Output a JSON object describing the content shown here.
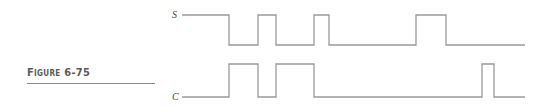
{
  "figure": {
    "label": "Figure 6-75"
  },
  "signals": [
    {
      "name": "S",
      "label_pos": [
        172,
        18
      ],
      "high_y": 15,
      "low_y": 45,
      "points": [
        [
          182,
          15
        ],
        [
          229,
          15
        ],
        [
          229,
          45
        ],
        [
          258,
          45
        ],
        [
          258,
          15
        ],
        [
          276,
          15
        ],
        [
          276,
          45
        ],
        [
          314,
          45
        ],
        [
          314,
          15
        ],
        [
          329,
          15
        ],
        [
          329,
          45
        ],
        [
          416,
          45
        ],
        [
          416,
          15
        ],
        [
          446,
          15
        ],
        [
          446,
          45
        ],
        [
          525,
          45
        ]
      ]
    },
    {
      "name": "C",
      "label_pos": [
        172,
        100
      ],
      "high_y": 64,
      "low_y": 97,
      "points": [
        [
          182,
          97
        ],
        [
          229,
          97
        ],
        [
          229,
          64
        ],
        [
          258,
          64
        ],
        [
          258,
          97
        ],
        [
          276,
          97
        ],
        [
          276,
          64
        ],
        [
          314,
          64
        ],
        [
          314,
          97
        ],
        [
          482,
          97
        ],
        [
          482,
          64
        ],
        [
          494,
          64
        ],
        [
          494,
          97
        ],
        [
          525,
          97
        ]
      ]
    }
  ],
  "colors": {
    "waveform": "#9a9a9a",
    "label_text": "#5a5a5a"
  }
}
